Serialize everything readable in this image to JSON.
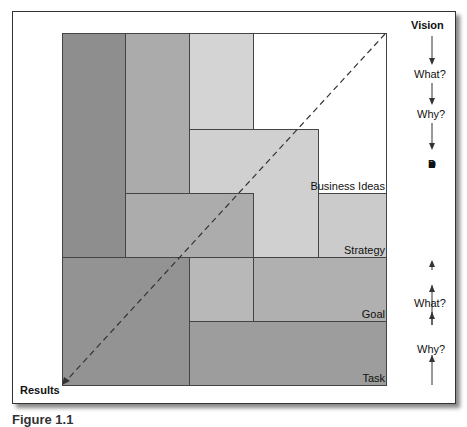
{
  "diagram": {
    "top_label": "Vision",
    "bottom_label": "Results",
    "right_axis": {
      "top_questions": [
        "What?",
        "Why?"
      ],
      "center_word": "Decisions",
      "center_letters": [
        "D",
        "e",
        "c",
        "i",
        "s",
        "i",
        "o",
        "n",
        "s"
      ],
      "bottom_questions": [
        "What?",
        "Why?"
      ]
    },
    "block_labels": {
      "business_ideas": "Business Ideas",
      "strategy": "Strategy",
      "goal": "Goal",
      "task": "Task"
    },
    "colors": {
      "darkest": "#8e8e8e",
      "dark": "#9c9c9c",
      "medium": "#ababab",
      "light": "#c8c8c8",
      "lightest": "#d6d6d6"
    }
  },
  "caption": "Figure 1.1"
}
